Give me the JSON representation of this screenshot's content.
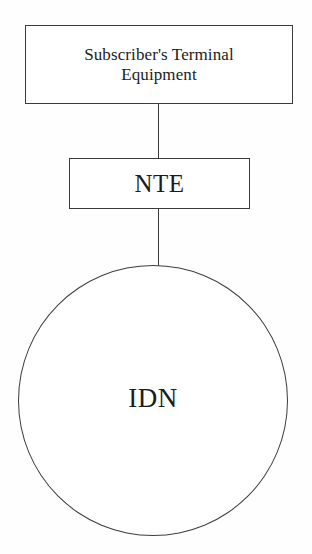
{
  "diagram": {
    "type": "block-diagram",
    "background_color": "#fefefe",
    "line_color": "#3a3a3a",
    "text_color": "#1c1c1c",
    "nodes": [
      {
        "id": "terminal-equipment",
        "shape": "rectangle",
        "label": "Subscriber's Terminal\nEquipment",
        "x": 25,
        "y": 25,
        "width": 268,
        "height": 79
      },
      {
        "id": "nte",
        "shape": "rectangle",
        "label": "NTE",
        "x": 69,
        "y": 158,
        "width": 181,
        "height": 51
      },
      {
        "id": "idn",
        "shape": "circle",
        "label": "IDN",
        "x": 18,
        "y": 265,
        "width": 270,
        "height": 271
      }
    ],
    "connectors": [
      {
        "id": "terminal-to-nte",
        "from": "terminal-equipment",
        "to": "nte",
        "orientation": "vertical",
        "style": "solid"
      },
      {
        "id": "nte-to-idn",
        "from": "nte",
        "to": "idn",
        "orientation": "vertical",
        "style": "solid"
      }
    ]
  }
}
